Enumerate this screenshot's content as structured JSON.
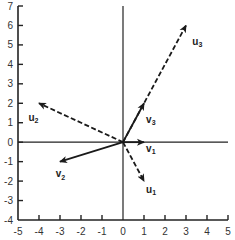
{
  "chart_data": {
    "type": "vector",
    "title": "",
    "xlabel": "",
    "ylabel": "",
    "xlim": [
      -5,
      5
    ],
    "ylim": [
      -4,
      7
    ],
    "x_ticks": [
      -5,
      -4,
      -3,
      -2,
      -1,
      0,
      1,
      2,
      3,
      4,
      5
    ],
    "y_ticks": [
      -4,
      -3,
      -2,
      -1,
      0,
      1,
      2,
      3,
      4,
      5,
      6,
      7
    ],
    "grid": false,
    "origin_axes": true,
    "vectors": [
      {
        "name": "v1",
        "base": "v",
        "sub": "1",
        "from": [
          0,
          0
        ],
        "to": [
          1,
          0
        ],
        "style": "solid",
        "label_pos": [
          1.1,
          -0.5
        ]
      },
      {
        "name": "v2",
        "base": "v",
        "sub": "2",
        "from": [
          0,
          0
        ],
        "to": [
          -3,
          -1
        ],
        "style": "solid",
        "label_pos": [
          -3.2,
          -1.8
        ]
      },
      {
        "name": "v3",
        "base": "v",
        "sub": "3",
        "from": [
          0,
          0
        ],
        "to": [
          1,
          2
        ],
        "style": "solid",
        "label_pos": [
          1.1,
          1.0
        ]
      },
      {
        "name": "u1",
        "base": "u",
        "sub": "1",
        "from": [
          0,
          0
        ],
        "to": [
          1,
          -2
        ],
        "style": "dashed",
        "label_pos": [
          1.1,
          -2.6
        ]
      },
      {
        "name": "u2",
        "base": "u",
        "sub": "2",
        "from": [
          0,
          0
        ],
        "to": [
          -4,
          2
        ],
        "style": "dashed",
        "label_pos": [
          -4.5,
          1.1
        ]
      },
      {
        "name": "u3",
        "base": "u",
        "sub": "3",
        "from": [
          0,
          0
        ],
        "to": [
          3,
          6
        ],
        "style": "dashed",
        "label_pos": [
          3.3,
          5.0
        ]
      }
    ]
  },
  "colors": {
    "axis": "#222222",
    "vector": "#1a1a1a",
    "text": "#333333"
  }
}
